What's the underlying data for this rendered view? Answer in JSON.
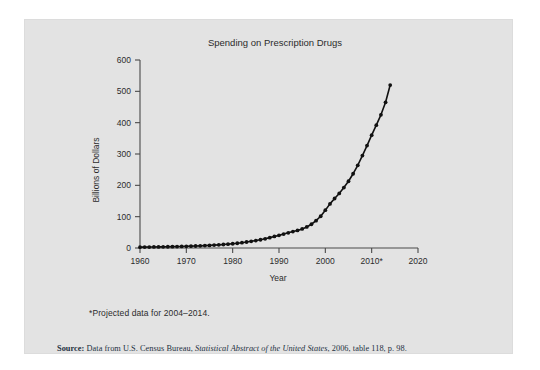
{
  "figure": {
    "title": "Spending on Prescription Drugs",
    "footnote": "*Projected data for 2004–2014.",
    "source": {
      "label": "Source:",
      "text_before": " Data from U.S. Census Bureau, ",
      "italic": "Statistical Abstract of the United States",
      "text_after": ", 2006, table 118, p. 98."
    },
    "background_color": "#e3e3e3",
    "line_color": "#111111"
  },
  "chart_data": {
    "type": "line",
    "title": "Spending on Prescription Drugs",
    "xlabel": "Year",
    "ylabel": "Billions of Dollars",
    "xlim": [
      1960,
      2020
    ],
    "ylim": [
      0,
      600
    ],
    "xticks": [
      1960,
      1970,
      1980,
      1990,
      2000,
      2010,
      2020
    ],
    "xtick_labels": [
      "1960",
      "1970",
      "1980",
      "1990",
      "2000",
      "2010*",
      "2020"
    ],
    "yticks": [
      0,
      100,
      200,
      300,
      400,
      500,
      600
    ],
    "ytick_labels": [
      "0",
      "100",
      "200",
      "300",
      "400",
      "500",
      "600"
    ],
    "grid": false,
    "legend": false,
    "markers": true,
    "x": [
      1960,
      1961,
      1962,
      1963,
      1964,
      1965,
      1966,
      1967,
      1968,
      1969,
      1970,
      1971,
      1972,
      1973,
      1974,
      1975,
      1976,
      1977,
      1978,
      1979,
      1980,
      1981,
      1982,
      1983,
      1984,
      1985,
      1986,
      1987,
      1988,
      1989,
      1990,
      1991,
      1992,
      1993,
      1994,
      1995,
      1996,
      1997,
      1998,
      1999,
      2000,
      2001,
      2002,
      2003,
      2004,
      2005,
      2006,
      2007,
      2008,
      2009,
      2010,
      2011,
      2012,
      2013,
      2014
    ],
    "values": [
      2.7,
      2.9,
      3.1,
      3.3,
      3.5,
      3.7,
      4.0,
      4.3,
      4.6,
      5.0,
      5.5,
      5.9,
      6.4,
      6.9,
      7.6,
      8.3,
      9.2,
      10.1,
      11.1,
      12.3,
      13.6,
      15.2,
      17.0,
      19.1,
      21.3,
      23.7,
      26.4,
      29.3,
      33.1,
      37.0,
      40.3,
      44.4,
      48.5,
      52.5,
      56.0,
      60.9,
      67.2,
      75.8,
      87.2,
      101.3,
      120.6,
      140.8,
      157.9,
      174.2,
      193.0,
      213.0,
      237.0,
      264.0,
      295.0,
      327.0,
      360.0,
      392.0,
      425.0,
      465.0,
      520.0
    ]
  }
}
